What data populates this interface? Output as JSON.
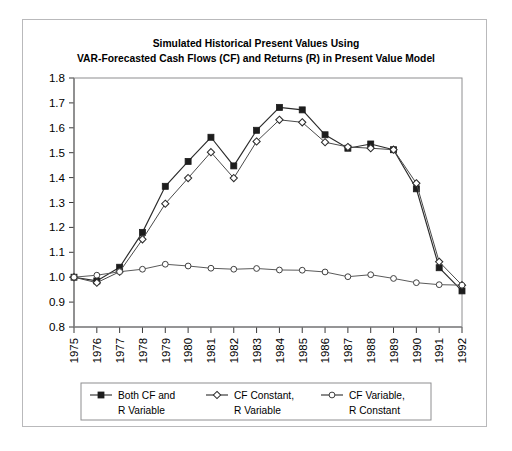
{
  "figure": {
    "title_line1": "Simulated Historical Present Values Using",
    "title_line2": "VAR-Forecasted Cash Flows (CF) and Returns (R) in Present Value Model"
  },
  "chart_data": {
    "type": "line",
    "title": "Simulated Historical Present Values Using VAR-Forecasted Cash Flows (CF) and Returns (R) in Present Value Model",
    "xlabel": "",
    "ylabel": "",
    "xlim": [
      1975,
      1992
    ],
    "ylim": [
      0.8,
      1.8
    ],
    "yticks": [
      "0.8",
      "0.9",
      "1.0",
      "1.1",
      "1.2",
      "1.3",
      "1.4",
      "1.5",
      "1.6",
      "1.7",
      "1.8"
    ],
    "grid": false,
    "legend_position": "below-axes",
    "categories": [
      "1975",
      "1976",
      "1977",
      "1978",
      "1979",
      "1980",
      "1981",
      "1982",
      "1983",
      "1984",
      "1985",
      "1986",
      "1987",
      "1988",
      "1989",
      "1990",
      "1991",
      "1992"
    ],
    "series": [
      {
        "name": "Both CF and R Variable",
        "marker": "filled-square",
        "values": [
          1.0,
          0.985,
          1.04,
          1.18,
          1.365,
          1.465,
          1.562,
          1.447,
          1.59,
          1.682,
          1.672,
          1.572,
          1.518,
          1.535,
          1.512,
          1.355,
          1.038,
          0.945
        ]
      },
      {
        "name": "CF Constant, R Variable",
        "marker": "open-diamond",
        "values": [
          1.0,
          0.978,
          1.022,
          1.152,
          1.295,
          1.398,
          1.502,
          1.398,
          1.545,
          1.632,
          1.622,
          1.542,
          1.523,
          1.518,
          1.512,
          1.377,
          1.062,
          0.968
        ]
      },
      {
        "name": "CF Variable, R Constant",
        "marker": "open-circle",
        "values": [
          1.0,
          1.008,
          1.022,
          1.032,
          1.052,
          1.045,
          1.036,
          1.032,
          1.035,
          1.029,
          1.028,
          1.021,
          1.002,
          1.01,
          0.995,
          0.978,
          0.97,
          0.968
        ]
      }
    ]
  },
  "legend": {
    "items": [
      {
        "line1": "Both CF and",
        "line2": "R Variable",
        "marker": "filled-square"
      },
      {
        "line1": "CF Constant,",
        "line2": "R Variable",
        "marker": "open-diamond"
      },
      {
        "line1": "CF Variable,",
        "line2": "R Constant",
        "marker": "open-circle"
      }
    ]
  }
}
